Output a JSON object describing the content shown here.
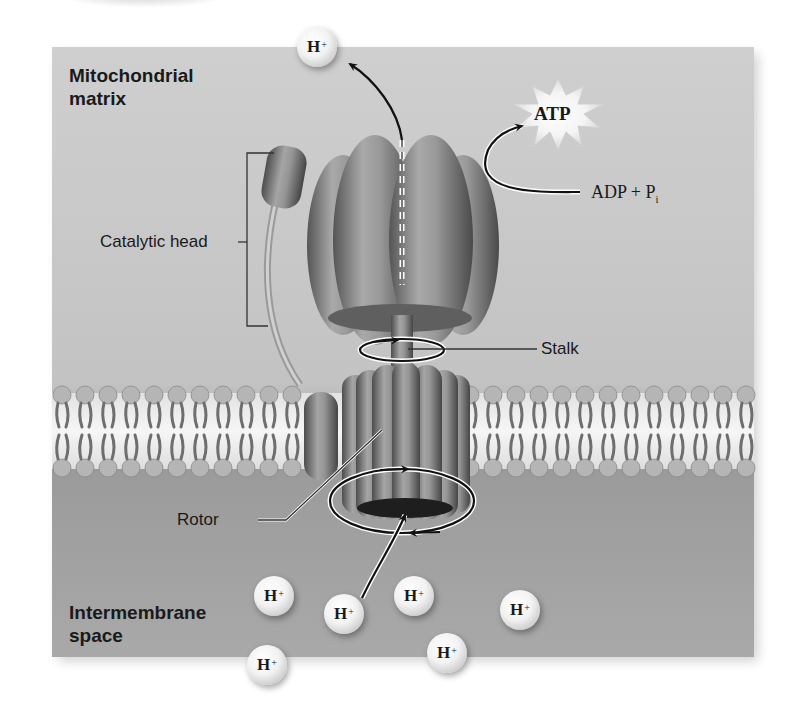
{
  "figure": {
    "regions": {
      "matrix_label_line1": "Mitochondrial",
      "matrix_label_line2": "matrix",
      "intermembrane_label_line1": "Intermembrane",
      "intermembrane_label_line2": "space"
    },
    "callouts": {
      "catalytic_head": "Catalytic head",
      "stalk": "Stalk",
      "rotor": "Rotor"
    },
    "reaction": {
      "product": "ATP",
      "reactants_base": "ADP + P",
      "reactants_subscript": "i"
    },
    "ions": {
      "symbol": "H",
      "charge": "+",
      "matrix_count": 1,
      "intermembrane_count": 6
    },
    "colors": {
      "matrix_bg": "#c9c9c9",
      "intermembrane_bg": "#8f8f8f",
      "membrane_core": "#efefef",
      "protein": "#7a7a7a",
      "arrow": "#111111"
    }
  }
}
